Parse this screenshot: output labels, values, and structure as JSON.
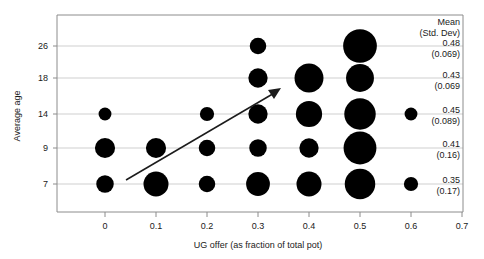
{
  "chart_data": {
    "type": "scatter",
    "title": "",
    "xlabel": "UG offer (as fraction of total pot)",
    "ylabel": "Average age",
    "xlim": [
      -0.05,
      0.7
    ],
    "ylim": [
      0,
      6
    ],
    "grid": "horizontal",
    "legend_position": "none",
    "x_ticks": [
      "0",
      "0.1",
      "0.2",
      "0.3",
      "0.4",
      "0.5",
      "0.6",
      "0.7"
    ],
    "x_tick_values": [
      0,
      0.1,
      0.2,
      0.3,
      0.4,
      0.5,
      0.6,
      0.7
    ],
    "y_categories": [
      "26",
      "18",
      "14",
      "9",
      "7"
    ],
    "bubble_note": "bubble area encodes proportion of offers at that value for the age group",
    "points": [
      {
        "age": "26",
        "offer": 0.3,
        "size": 6
      },
      {
        "age": "26",
        "offer": 0.5,
        "size": 34
      },
      {
        "age": "18",
        "offer": 0.3,
        "size": 9
      },
      {
        "age": "18",
        "offer": 0.4,
        "size": 24
      },
      {
        "age": "18",
        "offer": 0.5,
        "size": 22
      },
      {
        "age": "14",
        "offer": 0.0,
        "size": 3
      },
      {
        "age": "14",
        "offer": 0.2,
        "size": 4
      },
      {
        "age": "14",
        "offer": 0.3,
        "size": 9
      },
      {
        "age": "14",
        "offer": 0.4,
        "size": 19
      },
      {
        "age": "14",
        "offer": 0.5,
        "size": 29
      },
      {
        "age": "14",
        "offer": 0.6,
        "size": 3
      },
      {
        "age": "9",
        "offer": 0.0,
        "size": 10
      },
      {
        "age": "9",
        "offer": 0.1,
        "size": 10
      },
      {
        "age": "9",
        "offer": 0.2,
        "size": 6
      },
      {
        "age": "9",
        "offer": 0.3,
        "size": 7
      },
      {
        "age": "9",
        "offer": 0.4,
        "size": 9
      },
      {
        "age": "9",
        "offer": 0.5,
        "size": 32
      },
      {
        "age": "7",
        "offer": 0.0,
        "size": 7
      },
      {
        "age": "7",
        "offer": 0.1,
        "size": 17
      },
      {
        "age": "7",
        "offer": 0.2,
        "size": 6
      },
      {
        "age": "7",
        "offer": 0.3,
        "size": 15
      },
      {
        "age": "7",
        "offer": 0.4,
        "size": 17
      },
      {
        "age": "7",
        "offer": 0.5,
        "size": 27
      },
      {
        "age": "7",
        "offer": 0.6,
        "size": 4
      }
    ],
    "annotations": [
      {
        "name": "trend-arrow",
        "type": "arrow",
        "from": {
          "offer": 0.04,
          "age_row": "7"
        },
        "to": {
          "offer": 0.345,
          "age_row": "18"
        },
        "meaning": "offers increase with average age"
      }
    ],
    "stats_column": {
      "header_line1": "Mean",
      "header_line2": "(Std. Dev)",
      "rows": [
        {
          "age": "26",
          "mean": "0.48",
          "std_dev": "(0.069)"
        },
        {
          "age": "18",
          "mean": "0.43",
          "std_dev": "(0.069"
        },
        {
          "age": "14",
          "mean": "0.45",
          "std_dev": "(0.089)"
        },
        {
          "age": "9",
          "mean": "0.41",
          "std_dev": "(0.16)"
        },
        {
          "age": "7",
          "mean": "0.35",
          "std_dev": "(0.17)"
        }
      ]
    },
    "colors": {
      "bubble": "#000000",
      "gridline": "#c9c9c9",
      "axis": "#8c8c8c",
      "text": "#1a1a1a",
      "background": "#ffffff"
    }
  }
}
